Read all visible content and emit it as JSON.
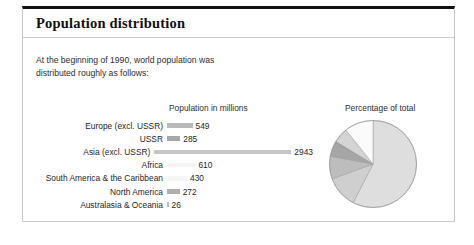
{
  "panel": {
    "title": "Population distribution"
  },
  "intro": {
    "line1": "At the beginning of 1990, world population was",
    "line2": "distributed roughly as follows:"
  },
  "bar_header": "Population in millions",
  "pie_header": "Percentage of total",
  "chart_data": {
    "type": "bar",
    "title": "Population in millions",
    "xlabel": "",
    "ylabel": "",
    "categories": [
      "Europe (excl. USSR)",
      "USSR",
      "Asia (excl. USSR)",
      "Africa",
      "South America & the Caribbean",
      "North America",
      "Australasia & Oceania"
    ],
    "values": [
      549,
      285,
      2943,
      610,
      430,
      272,
      26
    ],
    "value_labels": [
      "549",
      "285",
      "2943",
      "610",
      "430",
      "272",
      "26"
    ],
    "bar_colors": [
      "#b9b9b9",
      "#a8a8a8",
      "#c6c6c6",
      "#f4f4f4",
      "#f6f6f6",
      "#b0b0b0",
      "#bdbdbd"
    ],
    "xlim": [
      0,
      2943
    ],
    "grid": false,
    "legend": "none"
  },
  "pie_data": {
    "type": "pie",
    "title": "Percentage of total",
    "labels": [
      "Asia (excl. USSR)",
      "Africa",
      "South America & the Caribbean",
      "North America",
      "Australasia & Oceania",
      "USSR",
      "Europe (excl. USSR)"
    ],
    "values": [
      2943,
      610,
      430,
      272,
      26,
      285,
      549
    ],
    "percentages": [
      57.7,
      12.0,
      8.4,
      5.3,
      0.5,
      5.6,
      10.8
    ],
    "colors": [
      "#dedede",
      "#cfcfcf",
      "#bdbdbd",
      "#a6a6a6",
      "#8d8d8d",
      "#d4d4d4",
      "#fbfbfb"
    ],
    "legend": "none"
  }
}
